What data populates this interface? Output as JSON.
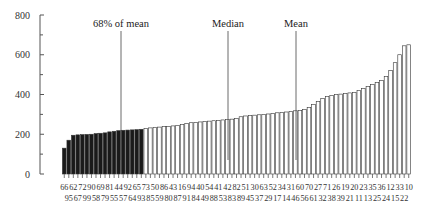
{
  "chart_data": {
    "type": "bar",
    "title": "",
    "xlabel": "",
    "ylabel": "",
    "ylim": [
      0,
      800
    ],
    "yticks": [
      0,
      200,
      400,
      600,
      800
    ],
    "grid": false,
    "legend": null,
    "categories": [
      "66",
      "95",
      "62",
      "67",
      "72",
      "99",
      "90",
      "58",
      "69",
      "79",
      "81",
      "55",
      "44",
      "57",
      "92",
      "64",
      "65",
      "93",
      "73",
      "85",
      "50",
      "59",
      "86",
      "80",
      "43",
      "87",
      "16",
      "91",
      "94",
      "84",
      "40",
      "49",
      "54",
      "88",
      "41",
      "53",
      "42",
      "83",
      "82",
      "89",
      "51",
      "45",
      "30",
      "37",
      "63",
      "29",
      "52",
      "17",
      "34",
      "14",
      "31",
      "46",
      "60",
      "56",
      "70",
      "61",
      "27",
      "32",
      "71",
      "38",
      "26",
      "39",
      "19",
      "21",
      "20",
      "11",
      "23",
      "13",
      "35",
      "25",
      "36",
      "24",
      "12",
      "15",
      "33",
      "22",
      "10"
    ],
    "values": [
      130,
      170,
      195,
      197,
      198,
      199,
      200,
      203,
      205,
      207,
      212,
      215,
      218,
      220,
      221,
      222,
      223,
      225,
      228,
      232,
      235,
      236,
      238,
      240,
      242,
      245,
      250,
      255,
      258,
      260,
      262,
      264,
      266,
      268,
      270,
      272,
      274,
      276,
      280,
      288,
      292,
      294,
      296,
      298,
      300,
      302,
      305,
      308,
      310,
      312,
      315,
      318,
      320,
      325,
      335,
      350,
      365,
      380,
      390,
      395,
      400,
      402,
      405,
      408,
      410,
      420,
      430,
      440,
      450,
      460,
      470,
      490,
      520,
      560,
      600,
      645,
      650
    ],
    "highlighted_count": 18,
    "highlight_note": "First 18 bars (below 68% of mean) drawn dark",
    "annotations": [
      {
        "label": "68% of mean",
        "value_x_index": 17.5
      },
      {
        "label": "Median",
        "value_x_index": 38.5
      },
      {
        "label": "Mean",
        "value_x_index": 55.5
      }
    ]
  },
  "axis": {
    "y_tick_labels": [
      "0",
      "200",
      "400",
      "600",
      "800"
    ]
  },
  "annotations": {
    "pct68": "68% of mean",
    "median": "Median",
    "mean": "Mean"
  },
  "x_labels_top": [
    "66",
    "62",
    "72",
    "90",
    "69",
    "81",
    "44",
    "92",
    "65",
    "73",
    "50",
    "86",
    "43",
    "16",
    "94",
    "40",
    "54",
    "41",
    "42",
    "82",
    "51",
    "30",
    "63",
    "52",
    "34",
    "31",
    "60",
    "70",
    "27",
    "71",
    "26",
    "19",
    "20",
    "23",
    "35",
    "36",
    "12",
    "33",
    "10"
  ],
  "x_labels_bottom": [
    "95",
    "67",
    "99",
    "58",
    "79",
    "55",
    "57",
    "64",
    "93",
    "85",
    "59",
    "80",
    "87",
    "91",
    "84",
    "49",
    "88",
    "53",
    "83",
    "89",
    "45",
    "37",
    "29",
    "17",
    "14",
    "46",
    "56",
    "61",
    "32",
    "38",
    "39",
    "21",
    "11",
    "13",
    "25",
    "24",
    "15",
    "22"
  ],
  "colors": {
    "dark_bar": "#1a1a1a",
    "light_bar": "#ffffff",
    "outline": "#333333",
    "axis": "#555555"
  }
}
